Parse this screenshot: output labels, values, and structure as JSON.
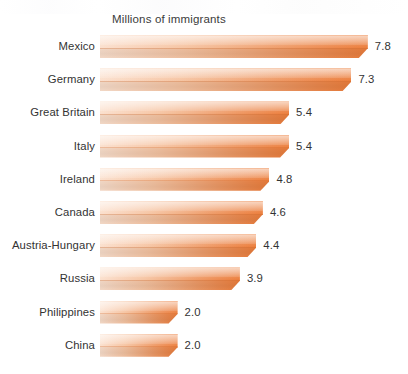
{
  "chart_data": {
    "type": "bar",
    "orientation": "horizontal",
    "title": "Millions of immigrants",
    "xlabel": "",
    "ylabel": "",
    "grid": false,
    "legend": null,
    "xlim": [
      0,
      8
    ],
    "value_suffix": "",
    "categories": [
      "Mexico",
      "Germany",
      "Great Britain",
      "Italy",
      "Ireland",
      "Canada",
      "Austria-Hungary",
      "Russia",
      "Philippines",
      "China"
    ],
    "values": [
      7.8,
      7.3,
      5.4,
      5.4,
      4.8,
      4.6,
      4.4,
      3.9,
      2.0,
      2.0
    ],
    "value_labels": [
      "7.8",
      "7.3",
      "5.4",
      "5.4",
      "4.8",
      "4.6",
      "4.4",
      "3.9",
      "2.0",
      "2.0"
    ],
    "colors": {
      "bar_light": "#fbe0cd",
      "bar_mid": "#f2ae83",
      "bar_dark": "#ec7e3c",
      "text": "#333333",
      "title_text": "#3b3b3b",
      "background": "#ffffff"
    }
  }
}
